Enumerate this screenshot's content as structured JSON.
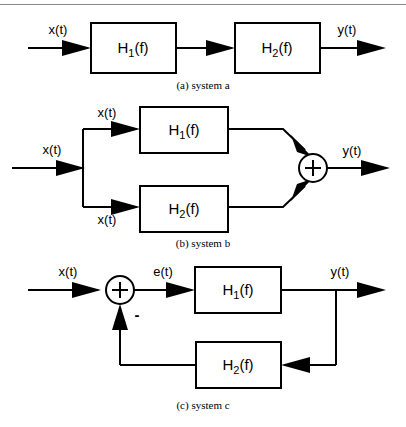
{
  "figure": {
    "top_rule": true,
    "blocks": {
      "h1": {
        "base": "H",
        "sub": "1",
        "arg": "(f)"
      },
      "h2": {
        "base": "H",
        "sub": "2",
        "arg": "(f)"
      }
    },
    "signals": {
      "x": "x(t)",
      "y": "y(t)",
      "e": "e(t)",
      "minus": "-"
    },
    "diagrams": [
      {
        "id": "system-a",
        "caption": "(a) system a",
        "description": "cascade of H1(f) and H2(f)",
        "labels": {
          "input": "x(t)",
          "output": "y(t)"
        },
        "blocks": [
          "H1(f)",
          "H2(f)"
        ]
      },
      {
        "id": "system-b",
        "caption": "(b) system b",
        "description": "parallel H1(f) and H2(f) summed",
        "labels": {
          "input": "x(t)",
          "branch_top": "x(t)",
          "branch_bottom": "x(t)",
          "output": "y(t)",
          "sum": "+"
        },
        "blocks": [
          "H1(f)",
          "H2(f)"
        ]
      },
      {
        "id": "system-c",
        "caption": "(c) system c",
        "description": "negative feedback loop, forward H1(f), feedback H2(f)",
        "labels": {
          "input": "x(t)",
          "error": "e(t)",
          "output": "y(t)",
          "sum": "+",
          "feedback_sign": "-"
        },
        "blocks": [
          "H1(f)",
          "H2(f)"
        ]
      }
    ]
  },
  "colors": {
    "ink": "#000000",
    "paper": "#ffffff",
    "rule": "#8a8a8a"
  }
}
